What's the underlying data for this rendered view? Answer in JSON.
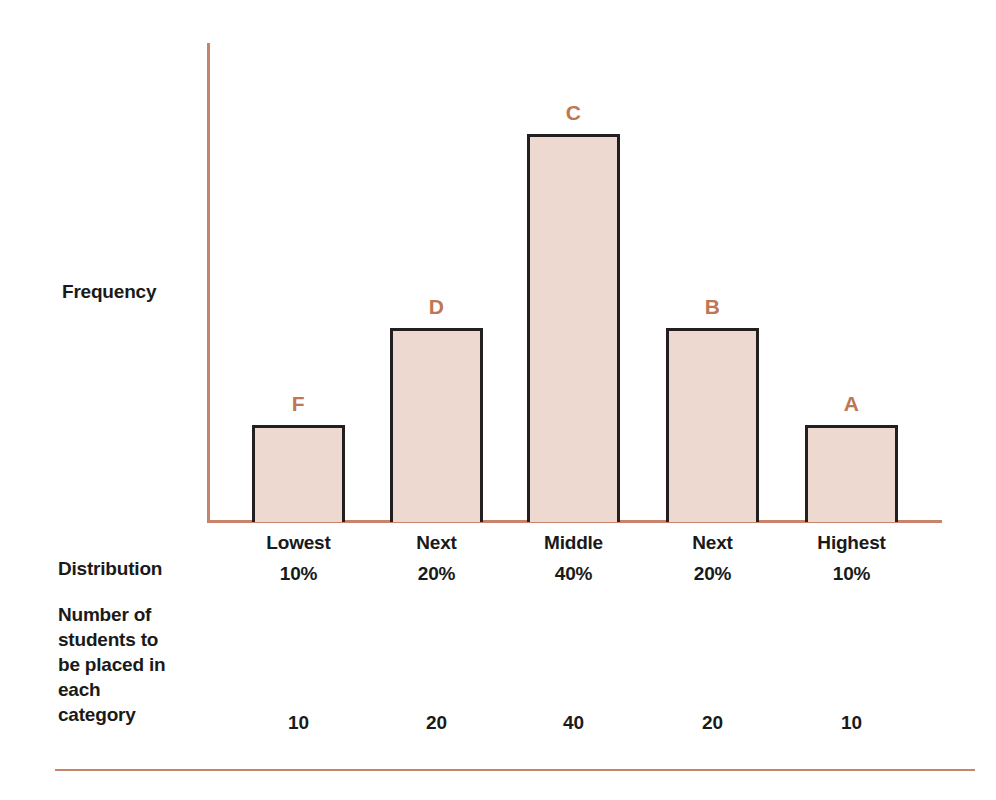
{
  "chart_data": {
    "type": "bar",
    "title": "",
    "xlabel": "",
    "ylabel": "Frequency",
    "grid": false,
    "legend": "none",
    "ylim": [
      0,
      50
    ],
    "categories": [
      "Lowest\n10%",
      "Next\n20%",
      "Middle\n40%",
      "Next\n20%",
      "Highest\n10%"
    ],
    "values": [
      10,
      20,
      40,
      20,
      10
    ],
    "bar_labels": [
      "F",
      "D",
      "C",
      "B",
      "A"
    ],
    "annotations": [
      "Distribution row: 10%, 20%, 40%, 20%, 10%",
      "Number of students to be placed in each category: 10, 20, 40, 20, 10"
    ],
    "colors": {
      "bar_fill": "#EED9D1",
      "bar_stroke": "#231F20",
      "axis": "#C9836A",
      "bar_label_text": "#BF7653",
      "body_text": "#1A1A1A"
    }
  },
  "axis": {
    "y_label": "Frequency"
  },
  "bars": [
    {
      "grade": "F",
      "name": "Lowest",
      "percent": "10%",
      "count": "10",
      "value": 10
    },
    {
      "grade": "D",
      "name": "Next",
      "percent": "20%",
      "count": "20",
      "value": 20
    },
    {
      "grade": "C",
      "name": "Middle",
      "percent": "40%",
      "count": "40",
      "value": 40
    },
    {
      "grade": "B",
      "name": "Next",
      "percent": "20%",
      "count": "20",
      "value": 20
    },
    {
      "grade": "A",
      "name": "Highest",
      "percent": "10%",
      "count": "10",
      "value": 10
    }
  ],
  "rows": {
    "distribution_label": "Distribution",
    "students_label": "Number of\nstudents to\nbe placed in\neach\ncategory"
  }
}
